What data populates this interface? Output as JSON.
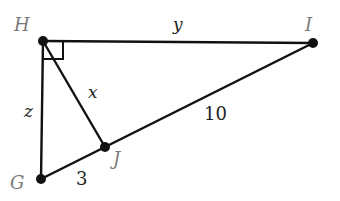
{
  "diagram": {
    "title": "",
    "type": "right triangle with altitude",
    "points": {
      "H": {
        "label": "H",
        "x": 43,
        "y": 41
      },
      "I": {
        "label": "I",
        "x": 313,
        "y": 43
      },
      "G": {
        "label": "G",
        "x": 41,
        "y": 179
      },
      "J": {
        "label": "J",
        "x": 105,
        "y": 147
      }
    },
    "segments": [
      {
        "from": "H",
        "to": "I",
        "label": "y"
      },
      {
        "from": "H",
        "to": "G",
        "label": "z"
      },
      {
        "from": "H",
        "to": "J",
        "label": "x"
      },
      {
        "from": "G",
        "to": "J",
        "label": "3"
      },
      {
        "from": "J",
        "to": "I",
        "label": "10"
      }
    ],
    "right_angle_at": "H",
    "labels": {
      "H": "H",
      "I": "I",
      "G": "G",
      "J": "J",
      "y": "y",
      "z": "z",
      "x": "x",
      "GJ": "3",
      "JI": "10"
    },
    "colors": {
      "line": "#111111",
      "point_label": "#7a7a7a",
      "value_label": "#222222"
    }
  }
}
